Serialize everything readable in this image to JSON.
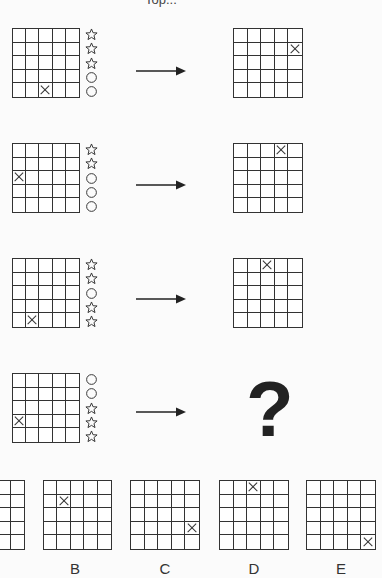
{
  "title": "Top...",
  "rows": [
    {
      "left_x": {
        "row": 5,
        "col": 3
      },
      "symbols": [
        "star",
        "star",
        "star",
        "circle",
        "circle"
      ],
      "right_x": {
        "row": 2,
        "col": 5
      }
    },
    {
      "left_x": {
        "row": 3,
        "col": 1
      },
      "symbols": [
        "star",
        "star",
        "circle",
        "circle",
        "circle"
      ],
      "right_x": {
        "row": 1,
        "col": 4
      }
    },
    {
      "left_x": {
        "row": 5,
        "col": 2
      },
      "symbols": [
        "star",
        "star",
        "circle",
        "star",
        "star"
      ],
      "right_x": {
        "row": 1,
        "col": 3
      }
    },
    {
      "left_x": {
        "row": 4,
        "col": 1
      },
      "symbols": [
        "circle",
        "circle",
        "star",
        "star",
        "star"
      ],
      "right_x": null,
      "right_label": "?"
    }
  ],
  "options": [
    {
      "label": "A",
      "x": null
    },
    {
      "label": "B",
      "x": {
        "row": 2,
        "col": 2
      }
    },
    {
      "label": "C",
      "x": {
        "row": 4,
        "col": 5
      }
    },
    {
      "label": "D",
      "x": {
        "row": 1,
        "col": 3
      }
    },
    {
      "label": "E",
      "x": {
        "row": 5,
        "col": 5
      }
    }
  ],
  "colors": {
    "line": "#333333",
    "background": "#fbfbfb"
  }
}
